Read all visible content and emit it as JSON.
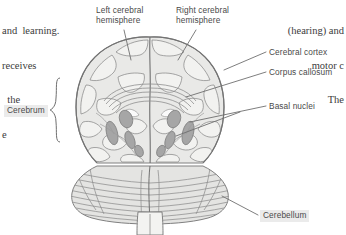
{
  "figure": {
    "view": "anterior/coronal view showing cerebral hemispheres, cerebral cortex, corpus callosum, basal nuclei, and cerebellum",
    "colors": {
      "outline": "#808080",
      "brain_fill": "#e9e9e7",
      "gyri_fill": "#f0f0ee",
      "basal_nuclei_fill": "#a8a8a8",
      "corpus_callosum": "#9a9a9a",
      "cerebellum_fill": "#e4e4e2",
      "label_text": "#4a4a4a",
      "label_box": "#ebebeb",
      "leader_line": "#6f6f6f",
      "body_text": "#3b3b3b",
      "background": "#ffffff"
    }
  },
  "body_text": {
    "left": [
      "and  learning.",
      "receives",
      "  the",
      "e"
    ],
    "right": [
      "(hearing) and",
      "motor c",
      "The"
    ]
  },
  "labels": {
    "left_hemisphere": "Left cerebral\nhemisphere",
    "right_hemisphere": "Right cerebral\nhemisphere",
    "cerebral_cortex": "Cerebral cortex",
    "corpus_callosum": "Corpus callosum",
    "basal_nuclei": "Basal nuclei",
    "cerebrum": "Cerebrum",
    "cerebellum": "Cerebellum"
  }
}
